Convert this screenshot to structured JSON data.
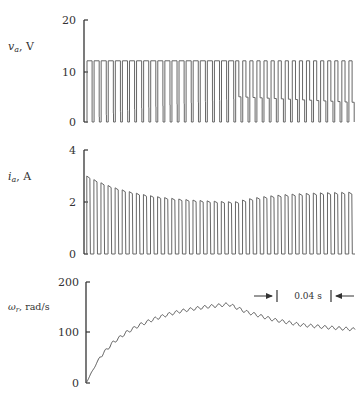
{
  "chart_data": [
    {
      "type": "line",
      "title": "",
      "ylabel": "v_a, V",
      "ylabel_main": "v",
      "ylabel_sub": "a",
      "ylabel_unit": ", V",
      "xlabel": "",
      "ylim": [
        0,
        20
      ],
      "yticks": [
        0,
        10,
        20
      ],
      "grid": false,
      "description": "PWM armature voltage: pulses between 0 and ~12 V; after switch point lower level rises to ~5 V",
      "series": [
        {
          "name": "v_a",
          "high_level": 12,
          "low_level_start": 0,
          "low_level_before_switch": 4.5,
          "low_level_after_switch": 5.0,
          "low_level_end": 3.8,
          "pulses": 38,
          "switch_fraction": 0.53
        }
      ]
    },
    {
      "type": "line",
      "title": "",
      "ylabel": "i_a, A",
      "ylabel_main": "i",
      "ylabel_sub": "a",
      "ylabel_unit": ", A",
      "xlabel": "",
      "ylim": [
        0,
        4
      ],
      "yticks": [
        0,
        2,
        4
      ],
      "grid": false,
      "description": "Pulsed armature current; peaks decay from ~3.0 A to ~2.0 A, then rise to ~2.4 A after switch",
      "series": [
        {
          "name": "i_a",
          "peak_start": 3.0,
          "peak_at_switch": 1.95,
          "peak_end": 2.4,
          "low_level": 0,
          "pulses": 38,
          "switch_fraction": 0.53
        }
      ]
    },
    {
      "type": "line",
      "title": "",
      "ylabel": "ω_r, rad/s",
      "ylabel_main": "ω",
      "ylabel_sub": "r",
      "ylabel_unit": ", rad/s",
      "xlabel": "",
      "ylim": [
        0,
        200
      ],
      "yticks": [
        0,
        100,
        200
      ],
      "grid": false,
      "description": "Rotor speed rises from 0 to ~155 rad/s, then decays to ~105 rad/s with small ripple",
      "series": [
        {
          "name": "omega_r",
          "x": [
            0,
            0.05,
            0.1,
            0.15,
            0.2,
            0.25,
            0.3,
            0.35,
            0.4,
            0.45,
            0.5,
            0.53,
            0.6,
            0.7,
            0.8,
            0.9,
            1.0
          ],
          "values": [
            0,
            50,
            80,
            100,
            115,
            126,
            135,
            142,
            147,
            151,
            154,
            156,
            140,
            125,
            115,
            110,
            106
          ]
        }
      ],
      "annotations": [
        {
          "text": "0.04 s",
          "type": "time-scale-bar"
        }
      ]
    }
  ],
  "labels": {
    "panel1_ticks": [
      "0",
      "10",
      "20"
    ],
    "panel2_ticks": [
      "0",
      "2",
      "4"
    ],
    "panel3_ticks": [
      "0",
      "100",
      "200"
    ],
    "scale_bar": "0.04 s"
  },
  "colors": {
    "trace": "#555555",
    "axis": "#333333",
    "text": "#333333"
  }
}
